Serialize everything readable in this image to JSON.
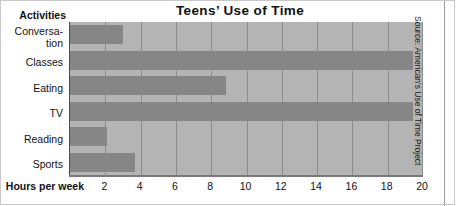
{
  "chart_data": {
    "type": "bar",
    "orientation": "horizontal",
    "title": "Teens’ Use of Time",
    "categories": [
      "Conversation",
      "Classes",
      "Eating",
      "TV",
      "Reading",
      "Sports"
    ],
    "category_labels_wrapped": [
      [
        "Conversa-",
        "tion"
      ],
      [
        "Classes"
      ],
      [
        "Eating"
      ],
      [
        "TV"
      ],
      [
        "Reading"
      ],
      [
        "Sports"
      ]
    ],
    "values": [
      3.0,
      19.4,
      8.8,
      19.4,
      2.1,
      3.7
    ],
    "series": [
      {
        "name": "Hours per week",
        "values": [
          3.0,
          19.4,
          8.8,
          19.4,
          2.1,
          3.7
        ]
      }
    ],
    "xlabel": "Hours per week",
    "ylabel": "Activities",
    "xlim": [
      0,
      20
    ],
    "xticks": [
      2,
      4,
      6,
      8,
      10,
      12,
      14,
      16,
      18,
      20
    ],
    "xtick_labels": [
      "2",
      "4",
      "6",
      "8",
      "10",
      "12",
      "14",
      "16",
      "18",
      "20"
    ],
    "grid": "vertical",
    "legend": "none",
    "annotations": [
      "Source: American's Use of Time Project"
    ],
    "colors": {
      "bar": "#868686",
      "plot_background": "#b4b4b4",
      "gridline": "#8c8c8c",
      "axis": "#4d4d4d",
      "text": "#111111"
    }
  },
  "source": {
    "text": "Source: American's Use of Time Project"
  }
}
